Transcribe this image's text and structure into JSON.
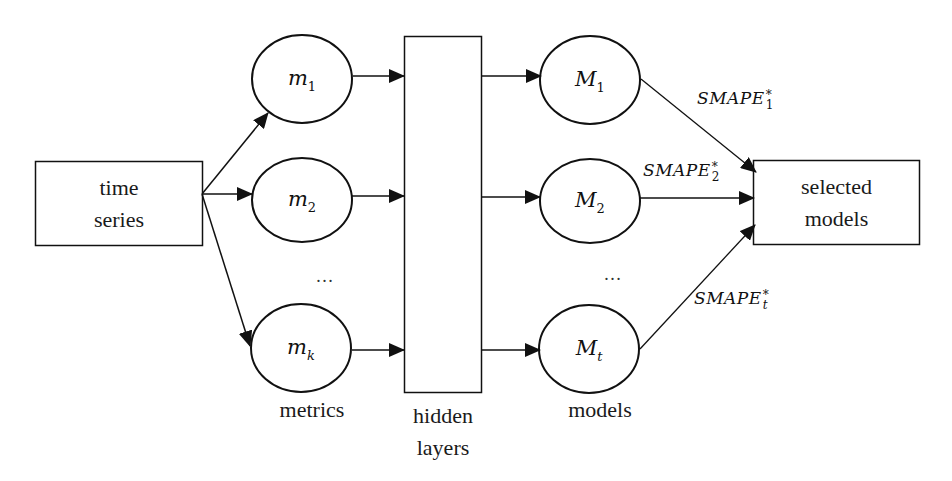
{
  "diagram": {
    "input": {
      "label_line1": "time",
      "label_line2": "series"
    },
    "metrics": {
      "nodes": [
        {
          "var": "m",
          "sub": "1"
        },
        {
          "var": "m",
          "sub": "2"
        },
        {
          "var": "m",
          "sub": "k"
        }
      ],
      "ellipsis": "…",
      "caption": "metrics"
    },
    "hidden": {
      "caption_line1": "hidden",
      "caption_line2": "layers"
    },
    "models": {
      "nodes": [
        {
          "var": "M",
          "sub": "1"
        },
        {
          "var": "M",
          "sub": "2"
        },
        {
          "var": "M",
          "sub": "t"
        }
      ],
      "ellipsis": "…",
      "caption": "models"
    },
    "edges_out": [
      {
        "label": "SMAPE",
        "sup": "*",
        "sub": "1"
      },
      {
        "label": "SMAPE",
        "sup": "*",
        "sub": "2"
      },
      {
        "label": "SMAPE",
        "sup": "*",
        "sub": "t"
      }
    ],
    "output": {
      "label_line1": "selected",
      "label_line2": "models"
    },
    "colors": {
      "stroke": "#111111",
      "background": "#ffffff"
    }
  }
}
